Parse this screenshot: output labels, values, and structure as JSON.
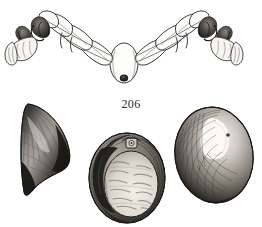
{
  "plate": {
    "figure_number": "206",
    "background_color": "#ffffff",
    "ink_color": "#3a3733",
    "width": 262,
    "height": 227
  },
  "figures": {
    "top": {
      "name": "segmented-appendage-pair",
      "description": "Bilaterally symmetric chain of elongated segments with a central oval head bearing a dark spot, terminating in dark claw-like structures and pale flat plates at both ends"
    },
    "bottom_left": {
      "name": "wedge-shell-specimen",
      "description": "Dark wedge shaped shell with fine radial striations, broad at top tapering to a point at lower left"
    },
    "bottom_center": {
      "name": "oval-shell-interior-specimen",
      "description": "Oval shell interior with ribbed crescent band at upper left, dark hinge detail at top centre and pale mottled central area"
    },
    "bottom_right": {
      "name": "oval-shell-exterior-specimen",
      "description": "Oval shell with concentric growth lines, dark margins and a bright highlight patch in the upper right"
    }
  },
  "palette": {
    "ink": "#3a3733",
    "shade_dark": "#1d1b19",
    "shade_mid": "#6e6963",
    "shade_light": "#c9c4bd",
    "highlight": "#fbfaf8",
    "paper": "#ffffff"
  }
}
